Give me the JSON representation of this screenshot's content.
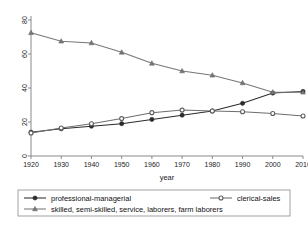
{
  "chart_data": {
    "type": "line",
    "title": "",
    "xlabel": "year",
    "ylabel": "",
    "x": [
      1920,
      1930,
      1940,
      1950,
      1960,
      1970,
      1980,
      1990,
      2000,
      2010
    ],
    "xticks": [
      "1920",
      "1930",
      "1940",
      "1950",
      "1960",
      "1970",
      "1980",
      "1990",
      "2000",
      "2010"
    ],
    "yticks": [
      "0",
      "20",
      "40",
      "60",
      "80"
    ],
    "ylim": [
      0,
      80
    ],
    "xlim": [
      1920,
      2010
    ],
    "grid": false,
    "legend_position": "below-axes",
    "series": [
      {
        "name": "professional-managerial",
        "marker": "filled-circle",
        "color": "#2b2b2b",
        "values": [
          14,
          16,
          17.5,
          19,
          21.5,
          24,
          26.5,
          31,
          37,
          38
        ]
      },
      {
        "name": "clerical-sales",
        "marker": "open-circle",
        "color": "#6e6e6e",
        "values": [
          13.5,
          16.5,
          19,
          22,
          25.5,
          27,
          26.5,
          26,
          25,
          23.5
        ]
      },
      {
        "name": "skilled, semi-skilled, service, laborers, farm laborers",
        "marker": "triangle",
        "color": "#777777",
        "values": [
          72.5,
          67.5,
          66.5,
          61,
          54.5,
          50,
          47.5,
          43,
          37.5,
          37.5
        ]
      }
    ]
  },
  "legend": {
    "entries": [
      {
        "label": "professional-managerial",
        "marker": "filled-circle"
      },
      {
        "label": "clerical-sales",
        "marker": "open-circle"
      },
      {
        "label": "skilled, semi-skilled, service, laborers, farm laborers",
        "marker": "triangle"
      }
    ]
  },
  "caption": {
    "text": ""
  }
}
